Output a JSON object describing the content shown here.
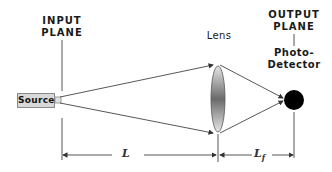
{
  "diagram": {
    "input_plane_label": [
      "INPUT",
      "PLANE"
    ],
    "output_plane_label": [
      "OUTPUT",
      "PLANE"
    ],
    "source_label": "Source",
    "lens_label": "Lens",
    "detector_label": [
      "Photo-",
      "Detector"
    ],
    "dimension_L": "L",
    "dimension_Lf": "L",
    "dimension_Lf_subscript": "f"
  },
  "colors": {
    "line": "#444444",
    "source_fill": "#d9d9d9",
    "detector_fill": "#000000",
    "lens_gradient_dark": "#6e6e6e",
    "lens_gradient_light": "#dcdcdc"
  }
}
